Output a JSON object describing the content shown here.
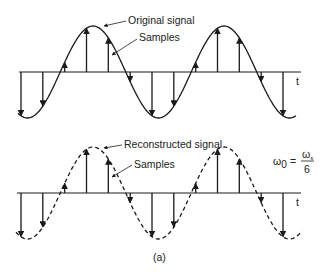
{
  "figure": {
    "caption": "(a)",
    "top_panel": {
      "curve_label": "Original signal",
      "samples_label": "Samples",
      "axis_label": "t",
      "curve_style": "solid"
    },
    "bottom_panel": {
      "curve_label": "Reconstructed signal",
      "samples_label": "Samples",
      "axis_label": "t",
      "curve_style": "dashed",
      "equation": {
        "lhs": "ω",
        "lhs_sub": "0",
        "eq": "=",
        "num": "ω",
        "num_sub": "s",
        "den": "6"
      }
    },
    "signal": {
      "samples_per_period": 6,
      "periods_shown": 2.2,
      "sample_count": 13
    },
    "colors": {
      "line": "#1a1a1a",
      "background": "#ffffff"
    }
  }
}
